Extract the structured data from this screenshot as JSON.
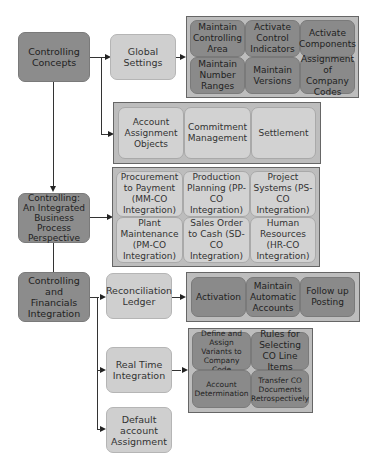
{
  "diagram": {
    "main_nodes": [
      {
        "id": "controlling-concepts",
        "label": "Controlling Concepts"
      },
      {
        "id": "integrated-business",
        "label": "Controlling: An Integrated Business Process Perspective"
      },
      {
        "id": "controlling-financials",
        "label": "Controlling and Financials Integration"
      }
    ],
    "sub_nodes": [
      {
        "id": "global-settings",
        "label": "Global Settings"
      },
      {
        "id": "reconciliation-ledger",
        "label": "Reconciliation Ledger"
      },
      {
        "id": "real-time-integration",
        "label": "Real Time Integration"
      },
      {
        "id": "default-account-assignment",
        "label": "Default account Assignment"
      }
    ],
    "panels": {
      "global_settings": [
        "Maintain Controlling Area",
        "Activate Control Indicators",
        "Activate Components",
        "Maintain Number Ranges",
        "Maintain Versions",
        "Assignment of Company Codes"
      ],
      "concepts": [
        "Account Assignment Objects",
        "Commitment Management",
        "Settlement"
      ],
      "integration": [
        "Procurement to Payment (MM-CO Integration)",
        "Production Planning (PP-CO Integration)",
        "Project Systems (PS-CO Integration)",
        "Plant Maintenance (PM-CO Integration)",
        "Sales Order to Cash (SD-CO Integration)",
        "Human Resources (HR-CO Integration)"
      ],
      "reconciliation": [
        "Activation",
        "Maintain Automatic Accounts",
        "Follow up Posting"
      ],
      "real_time": [
        "Define and Assign Variants to Company Code",
        "Rules for Selecting CO Line Items",
        "Account Determination",
        "Transfer CO Documents Retrospectively"
      ]
    },
    "colors": {
      "dark_node": "#8c8c8c",
      "light_node": "#cfcfcf",
      "panel_bg": "#bdbdbd",
      "connector": "#333333"
    }
  }
}
